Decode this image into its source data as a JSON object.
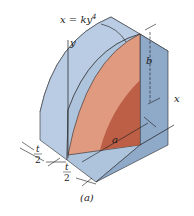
{
  "figure": {
    "caption": "(a)",
    "equation": "x = ky",
    "equation_exponent": "4",
    "labels": {
      "y_axis": "y",
      "x_axis": "x",
      "dim_a": "a",
      "dim_b": "b",
      "dim_t_num_left": "t",
      "dim_t_den_left": "2",
      "dim_t_num_right": "t",
      "dim_t_den_right": "2"
    },
    "colors": {
      "block_top": "#c3d3e6",
      "block_front": "#aec3dc",
      "block_side": "#8fa9c8",
      "region_light": "#e09a80",
      "region_dark": "#b5553c",
      "outline": "#2a2a2a"
    }
  }
}
